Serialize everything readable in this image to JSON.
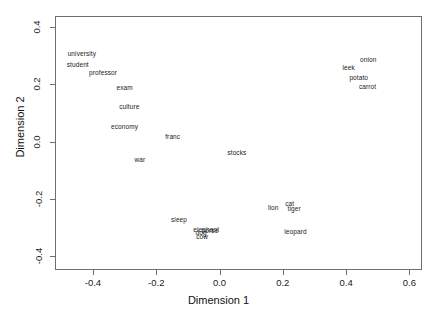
{
  "chart_data": {
    "type": "scatter",
    "title": "",
    "xlabel": "Dimension 1",
    "ylabel": "Dimension 2",
    "xlim": [
      -0.52,
      0.64
    ],
    "ylim": [
      -0.45,
      0.44
    ],
    "xticks": [
      -0.4,
      -0.2,
      0.0,
      0.2,
      0.4,
      0.6
    ],
    "xticklabels": [
      "-0.4",
      "-0.2",
      "0.0",
      "0.2",
      "0.4",
      "0.6"
    ],
    "yticks": [
      -0.4,
      -0.2,
      0.0,
      0.2,
      0.4
    ],
    "yticklabels": [
      "-0.4",
      "-0.2",
      "0.0",
      "0.2",
      "0.4"
    ],
    "grid": false,
    "legend": false,
    "marker": "text-label",
    "points": [
      {
        "label": "university",
        "x": -0.435,
        "y": 0.31
      },
      {
        "label": "student",
        "x": -0.448,
        "y": 0.272
      },
      {
        "label": "professor",
        "x": -0.368,
        "y": 0.243
      },
      {
        "label": "exam",
        "x": -0.3,
        "y": 0.19
      },
      {
        "label": "culture",
        "x": -0.285,
        "y": 0.124
      },
      {
        "label": "economy",
        "x": -0.3,
        "y": 0.054
      },
      {
        "label": "franc",
        "x": -0.148,
        "y": 0.018
      },
      {
        "label": "war",
        "x": -0.252,
        "y": -0.062
      },
      {
        "label": "stocks",
        "x": 0.055,
        "y": -0.038
      },
      {
        "label": "leek",
        "x": 0.408,
        "y": 0.262
      },
      {
        "label": "onion",
        "x": 0.47,
        "y": 0.288
      },
      {
        "label": "potato",
        "x": 0.44,
        "y": 0.228
      },
      {
        "label": "carrot",
        "x": 0.468,
        "y": 0.196
      },
      {
        "label": "lion",
        "x": 0.17,
        "y": -0.228
      },
      {
        "label": "cat",
        "x": 0.222,
        "y": -0.214
      },
      {
        "label": "tiger",
        "x": 0.236,
        "y": -0.232
      },
      {
        "label": "leopard",
        "x": 0.24,
        "y": -0.312
      },
      {
        "label": "sleep",
        "x": -0.128,
        "y": -0.272
      },
      {
        "label": "dog",
        "x": -0.058,
        "y": -0.318
      },
      {
        "label": "elephant",
        "x": -0.042,
        "y": -0.308
      },
      {
        "label": "horse",
        "x": -0.03,
        "y": -0.31
      },
      {
        "label": "cow",
        "x": -0.055,
        "y": -0.33
      }
    ]
  },
  "axes": {
    "x_title": "Dimension 1",
    "y_title": "Dimension 2"
  }
}
